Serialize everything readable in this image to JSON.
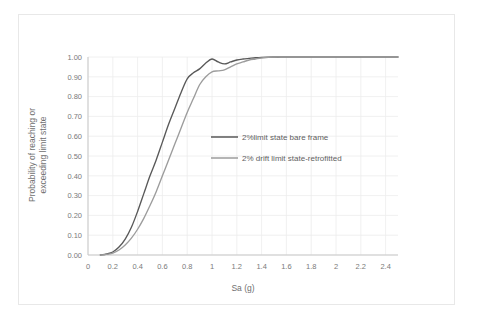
{
  "chart_data": {
    "type": "line",
    "title": "",
    "xlabel": "Sa (g)",
    "ylabel": "Probability of reaching or exceeding limit state",
    "ylabel_line1": "Probability of reaching or",
    "ylabel_line2": "exceeding limit state",
    "xlim": [
      0,
      2.5
    ],
    "ylim": [
      0,
      1.0
    ],
    "xticks": [
      0,
      0.2,
      0.4,
      0.6,
      0.8,
      1,
      1.2,
      1.4,
      1.6,
      1.8,
      2,
      2.2,
      2.4
    ],
    "xticklabels": [
      "0",
      "0.2",
      "0.4",
      "0.6",
      "0.8",
      "1",
      "1.2",
      "1.4",
      "1.6",
      "1.8",
      "2",
      "2.2",
      "2.4"
    ],
    "yticks": [
      0.0,
      0.1,
      0.2,
      0.3,
      0.4,
      0.5,
      0.6,
      0.7,
      0.8,
      0.9,
      1.0
    ],
    "yticklabels": [
      "0.00",
      "0.10",
      "0.20",
      "0.30",
      "0.40",
      "0.50",
      "0.60",
      "0.70",
      "0.80",
      "0.90",
      "1.00"
    ],
    "grid": true,
    "legend_position": "inside-center-right",
    "series": [
      {
        "name": "2%limit state bare frame",
        "color": "#595959",
        "x": [
          0.1,
          0.15,
          0.2,
          0.25,
          0.3,
          0.35,
          0.4,
          0.45,
          0.5,
          0.55,
          0.6,
          0.65,
          0.7,
          0.75,
          0.8,
          0.85,
          0.9,
          0.95,
          1.0,
          1.05,
          1.1,
          1.15,
          1.2,
          1.25,
          1.3,
          1.35,
          1.4,
          1.5,
          1.6,
          1.8,
          2.0,
          2.2,
          2.5
        ],
        "y": [
          0.0,
          0.005,
          0.015,
          0.04,
          0.08,
          0.14,
          0.22,
          0.31,
          0.4,
          0.48,
          0.57,
          0.66,
          0.74,
          0.82,
          0.89,
          0.92,
          0.94,
          0.97,
          0.99,
          0.975,
          0.965,
          0.975,
          0.985,
          0.99,
          0.993,
          0.996,
          0.998,
          1.0,
          1.0,
          1.0,
          1.0,
          1.0,
          1.0
        ]
      },
      {
        "name": "2% drift limit state-retrofitted",
        "color": "#9c9c9c",
        "x": [
          0.1,
          0.15,
          0.2,
          0.25,
          0.3,
          0.35,
          0.4,
          0.45,
          0.5,
          0.55,
          0.6,
          0.65,
          0.7,
          0.75,
          0.8,
          0.85,
          0.9,
          0.95,
          1.0,
          1.05,
          1.1,
          1.15,
          1.2,
          1.25,
          1.3,
          1.35,
          1.4,
          1.5,
          1.6,
          1.8,
          2.0,
          2.2,
          2.5
        ],
        "y": [
          0.0,
          0.003,
          0.01,
          0.025,
          0.05,
          0.085,
          0.13,
          0.185,
          0.25,
          0.32,
          0.4,
          0.48,
          0.56,
          0.64,
          0.72,
          0.79,
          0.86,
          0.9,
          0.925,
          0.93,
          0.935,
          0.95,
          0.965,
          0.975,
          0.985,
          0.99,
          0.995,
          1.0,
          1.0,
          1.0,
          1.0,
          1.0,
          1.0
        ]
      }
    ],
    "legend_entries": [
      {
        "label": "2%limit state bare frame",
        "color": "#595959"
      },
      {
        "label": "2% drift limit state-retrofitted",
        "color": "#9c9c9c"
      }
    ]
  },
  "colors": {
    "series_dark": "#595959",
    "series_light": "#9c9c9c",
    "gridline": "#ececec",
    "axis": "#c9c9c9",
    "tick_text": "#7a7a7a",
    "frame_border": "#e8e8e8",
    "background": "#ffffff"
  }
}
